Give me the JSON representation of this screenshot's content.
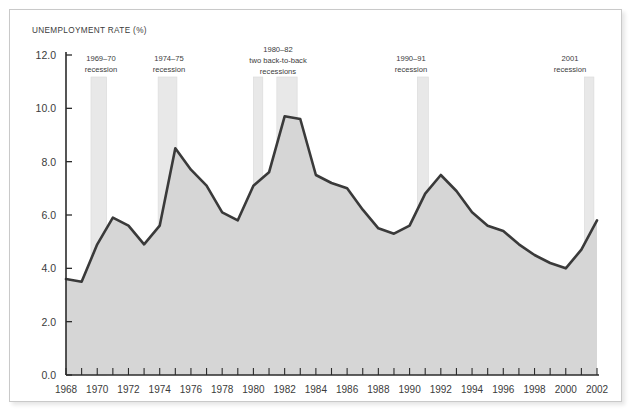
{
  "chart_data": {
    "type": "area",
    "title": "UNEMPLOYMENT RATE (%)",
    "xlabel": "",
    "ylabel": "UNEMPLOYMENT RATE (%)",
    "xlim": [
      1968,
      2002
    ],
    "ylim": [
      0.0,
      12.0
    ],
    "grid": false,
    "legend": "none",
    "y_ticks": [
      "0.0",
      "2.0",
      "4.0",
      "6.0",
      "8.0",
      "10.0",
      "12.0"
    ],
    "y_tick_values": [
      0.0,
      2.0,
      4.0,
      6.0,
      8.0,
      10.0,
      12.0
    ],
    "x_ticks": [
      "1968",
      "1970",
      "1972",
      "1974",
      "1976",
      "1978",
      "1980",
      "1982",
      "1984",
      "1986",
      "1988",
      "1990",
      "1992",
      "1994",
      "1996",
      "1998",
      "2000",
      "2002"
    ],
    "x_tick_values": [
      1968,
      1970,
      1972,
      1974,
      1976,
      1978,
      1980,
      1982,
      1984,
      1986,
      1988,
      1990,
      1992,
      1994,
      1996,
      1998,
      2000,
      2002
    ],
    "x": [
      1968,
      1969,
      1970,
      1971,
      1972,
      1973,
      1974,
      1975,
      1976,
      1977,
      1978,
      1979,
      1980,
      1981,
      1982,
      1983,
      1984,
      1985,
      1986,
      1987,
      1988,
      1989,
      1990,
      1991,
      1992,
      1993,
      1994,
      1995,
      1996,
      1997,
      1998,
      1999,
      2000,
      2001,
      2002
    ],
    "values": [
      3.6,
      3.5,
      4.9,
      5.9,
      5.6,
      4.9,
      5.6,
      8.5,
      7.7,
      7.1,
      6.1,
      5.8,
      7.1,
      7.6,
      9.7,
      9.6,
      7.5,
      7.2,
      7.0,
      6.2,
      5.5,
      5.3,
      5.6,
      6.8,
      7.5,
      6.9,
      6.1,
      5.6,
      5.4,
      4.9,
      4.5,
      4.2,
      4.0,
      4.7,
      5.8
    ],
    "series_name": "Unemployment rate",
    "line_color": "#3a3a3a",
    "fill_color": "#d6d6d6",
    "recession_band_color": "#e8e8e8",
    "annotations": [
      {
        "id": "rec-1969",
        "label_line1": "1969–70",
        "label_line2": "recession",
        "start": 1969.6,
        "end": 1970.6
      },
      {
        "id": "rec-1974",
        "label_line1": "1974–75",
        "label_line2": "recession",
        "start": 1973.9,
        "end": 1975.1
      },
      {
        "id": "rec-1980",
        "label_line1": "1980–82",
        "label_line2": "two back-to-back",
        "label_line3": "recessions",
        "start": 1980.0,
        "end": 1980.6
      },
      {
        "id": "rec-1981",
        "label_line1": "",
        "label_line2": "",
        "start": 1981.5,
        "end": 1982.8
      },
      {
        "id": "rec-1990",
        "label_line1": "1990–91",
        "label_line2": "recession",
        "start": 1990.5,
        "end": 1991.2
      },
      {
        "id": "rec-2001",
        "label_line1": "2001",
        "label_line2": "recession",
        "start": 2001.2,
        "end": 2001.8
      }
    ]
  },
  "labels": {
    "title": "UNEMPLOYMENT RATE (%)",
    "rec1_l1": "1969–70",
    "rec1_l2": "recession",
    "rec2_l1": "1974–75",
    "rec2_l2": "recession",
    "rec3_l1": "1980–82",
    "rec3_l2": "two back-to-back",
    "rec3_l3": "recessions",
    "rec5_l1": "1990–91",
    "rec5_l2": "recession",
    "rec6_l1": "2001",
    "rec6_l2": "recession"
  }
}
